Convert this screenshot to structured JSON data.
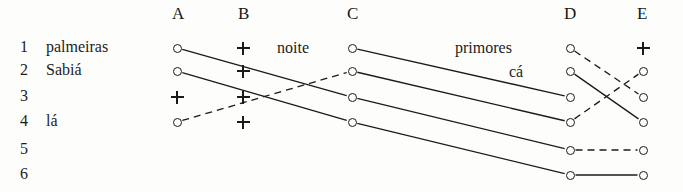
{
  "figure": {
    "title": "",
    "width": 683,
    "height": 192,
    "background_color": "#fdfdfc",
    "ink_color": "#1a1a1a"
  },
  "columns": [
    {
      "id": "A",
      "label": "A",
      "x": 177,
      "header_x": 172,
      "header_y": 4
    },
    {
      "id": "B",
      "label": "B",
      "x": 243,
      "header_x": 238,
      "header_y": 4
    },
    {
      "id": "C",
      "label": "C",
      "x": 352,
      "header_x": 347,
      "header_y": 4
    },
    {
      "id": "D",
      "label": "D",
      "x": 570,
      "header_x": 564,
      "header_y": 4
    },
    {
      "id": "E",
      "label": "E",
      "x": 643,
      "header_x": 637,
      "header_y": 4
    }
  ],
  "rows": [
    {
      "index": 1,
      "number": "1",
      "word": "palmeiras",
      "y": 48
    },
    {
      "index": 2,
      "number": "2",
      "word": "Sabiá",
      "y": 71
    },
    {
      "index": 3,
      "number": "3",
      "word": "",
      "y": 97
    },
    {
      "index": 4,
      "number": "4",
      "word": "lá",
      "y": 122
    },
    {
      "index": 5,
      "number": "5",
      "word": "",
      "y": 150
    },
    {
      "index": 6,
      "number": "6",
      "word": "",
      "y": 175
    }
  ],
  "row_number_x": 26,
  "row_word_x": 46,
  "nodes": [
    {
      "col": "A",
      "row": 1,
      "marker": "circle"
    },
    {
      "col": "A",
      "row": 2,
      "marker": "circle"
    },
    {
      "col": "A",
      "row": 3,
      "marker": "plus"
    },
    {
      "col": "A",
      "row": 4,
      "marker": "circle"
    },
    {
      "col": "B",
      "row": 1,
      "marker": "plus"
    },
    {
      "col": "B",
      "row": 2,
      "marker": "plus"
    },
    {
      "col": "B",
      "row": 3,
      "marker": "plus"
    },
    {
      "col": "B",
      "row": 4,
      "marker": "plus"
    },
    {
      "col": "C",
      "row": 1,
      "marker": "circle"
    },
    {
      "col": "C",
      "row": 2,
      "marker": "circle"
    },
    {
      "col": "C",
      "row": 3,
      "marker": "circle"
    },
    {
      "col": "C",
      "row": 4,
      "marker": "circle"
    },
    {
      "col": "D",
      "row": 1,
      "marker": "circle"
    },
    {
      "col": "D",
      "row": 2,
      "marker": "circle"
    },
    {
      "col": "D",
      "row": 3,
      "marker": "circle"
    },
    {
      "col": "D",
      "row": 4,
      "marker": "circle"
    },
    {
      "col": "D",
      "row": 5,
      "marker": "circle"
    },
    {
      "col": "D",
      "row": 6,
      "marker": "circle"
    },
    {
      "col": "E",
      "row": 1,
      "marker": "plus"
    },
    {
      "col": "E",
      "row": 2,
      "marker": "circle"
    },
    {
      "col": "E",
      "row": 3,
      "marker": "circle"
    },
    {
      "col": "E",
      "row": 4,
      "marker": "circle"
    },
    {
      "col": "E",
      "row": 5,
      "marker": "circle"
    },
    {
      "col": "E",
      "row": 6,
      "marker": "circle"
    }
  ],
  "edges": [
    {
      "from": {
        "col": "A",
        "row": 1
      },
      "to": {
        "col": "C",
        "row": 3
      },
      "style": "solid"
    },
    {
      "from": {
        "col": "A",
        "row": 2
      },
      "to": {
        "col": "C",
        "row": 4
      },
      "style": "solid"
    },
    {
      "from": {
        "col": "A",
        "row": 4
      },
      "to": {
        "col": "C",
        "row": 2
      },
      "style": "dashed"
    },
    {
      "from": {
        "col": "C",
        "row": 1
      },
      "to": {
        "col": "D",
        "row": 3
      },
      "style": "solid"
    },
    {
      "from": {
        "col": "C",
        "row": 2
      },
      "to": {
        "col": "D",
        "row": 4
      },
      "style": "solid"
    },
    {
      "from": {
        "col": "C",
        "row": 3
      },
      "to": {
        "col": "D",
        "row": 5
      },
      "style": "solid"
    },
    {
      "from": {
        "col": "C",
        "row": 4
      },
      "to": {
        "col": "D",
        "row": 6
      },
      "style": "solid"
    },
    {
      "from": {
        "col": "D",
        "row": 1
      },
      "to": {
        "col": "E",
        "row": 3
      },
      "style": "dashed"
    },
    {
      "from": {
        "col": "D",
        "row": 2
      },
      "to": {
        "col": "E",
        "row": 4
      },
      "style": "solid"
    },
    {
      "from": {
        "col": "D",
        "row": 4
      },
      "to": {
        "col": "E",
        "row": 2
      },
      "style": "dashed"
    },
    {
      "from": {
        "col": "D",
        "row": 5
      },
      "to": {
        "col": "E",
        "row": 5
      },
      "style": "dashed"
    },
    {
      "from": {
        "col": "D",
        "row": 6
      },
      "to": {
        "col": "E",
        "row": 6
      },
      "style": "solid"
    }
  ],
  "annotations": [
    {
      "id": "noite",
      "text": "noite",
      "x": 277,
      "y": 39
    },
    {
      "id": "primores",
      "text": "primores",
      "x": 455,
      "y": 39
    },
    {
      "id": "ca",
      "text": "cá",
      "x": 509,
      "y": 63
    }
  ]
}
